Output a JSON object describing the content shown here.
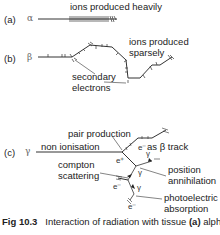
{
  "figure": {
    "parts": [
      {
        "id": "a",
        "label": "(a)",
        "particle": "α",
        "annotation": "ions produced heavily"
      },
      {
        "id": "b",
        "label": "(b)",
        "particle": "β",
        "annotations": [
          "ions produced sparsely",
          "secondary electrons"
        ]
      },
      {
        "id": "c",
        "label": "(c)",
        "particle": "γ",
        "annotations": [
          "pair production",
          "non ionisation",
          "as β track",
          "compton scattering",
          "position annihilation",
          "photoelectric absorption"
        ],
        "symbols": [
          "e⁻",
          "e⁺",
          "γ",
          "γ",
          "e⁻",
          "γ",
          "e⁻"
        ]
      }
    ],
    "labels": {
      "ions_heavily": "ions produced heavily",
      "ions_sparsely_1": "ions produced",
      "ions_sparsely_2": "sparsely",
      "secondary_1": "secondary",
      "secondary_2": "electrons",
      "pair_production": "pair production",
      "non_ionisation": "non ionisation",
      "as_beta_track": "as β track",
      "compton_1": "compton",
      "compton_2": "scattering",
      "position_1": "position",
      "position_2": "annihilation",
      "photo_1": "photoelectric",
      "photo_2": "absorption",
      "e_minus": "e⁻",
      "e_plus": "e⁺",
      "gamma": "γ",
      "alpha": "α",
      "beta": "β"
    },
    "part_labels": {
      "a": "(a)",
      "b": "(b)",
      "c": "(c)"
    },
    "caption": {
      "number": "Fig 10.3",
      "text": "Interaction of radiation with tissue",
      "part": "(a)",
      "tail": "alpha"
    }
  }
}
